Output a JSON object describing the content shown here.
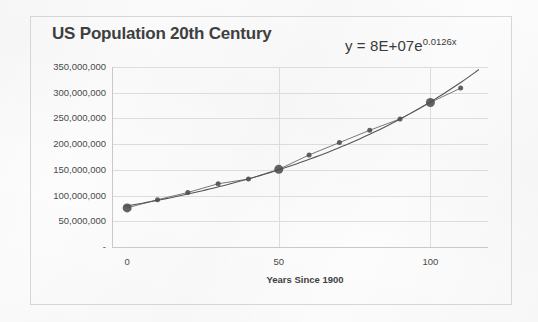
{
  "chart_data": {
    "type": "scatter",
    "title": "US Population 20th Century",
    "xlabel": "Years Since 1900",
    "ylabel": "",
    "annotation": "y = 8E+07e",
    "annotation_exponent": "0.0126x",
    "annotation_full": "y = 8E+07e^0.0126x",
    "trendline": "exponential",
    "grid": "horizontal",
    "legend": "none",
    "xlim": [
      -5,
      119
    ],
    "ylim": [
      0,
      350000000
    ],
    "x_ticks": [
      0,
      50,
      100
    ],
    "x_tick_labels": [
      "0",
      "50",
      "100"
    ],
    "y_ticks": [
      0,
      50000000,
      100000000,
      150000000,
      200000000,
      250000000,
      300000000,
      350000000
    ],
    "y_tick_labels": [
      "-",
      "50,000,000",
      "100,000,000",
      "150,000,000",
      "200,000,000",
      "250,000,000",
      "300,000,000",
      "350,000,000"
    ],
    "x": [
      0,
      10,
      20,
      30,
      40,
      50,
      60,
      70,
      80,
      90,
      100,
      110
    ],
    "values": [
      76000000,
      92000000,
      106000000,
      123000000,
      132000000,
      151000000,
      179000000,
      203000000,
      227000000,
      249000000,
      281000000,
      309000000
    ],
    "point_sizes": [
      9,
      5,
      5,
      5,
      5,
      9,
      5,
      5,
      5,
      5,
      9,
      5
    ],
    "series": [
      {
        "name": "US Population",
        "x": [
          0,
          10,
          20,
          30,
          40,
          50,
          60,
          70,
          80,
          90,
          100,
          110
        ],
        "values": [
          76000000,
          92000000,
          106000000,
          123000000,
          132000000,
          151000000,
          179000000,
          203000000,
          227000000,
          249000000,
          281000000,
          309000000
        ]
      }
    ],
    "colors": {
      "marker": "#4c4c4c",
      "trendline": "#555555",
      "gridline": "#dcdcdc",
      "axis": "#c9c9c9",
      "text": "#3f3f3f",
      "background": "#fdfdfd",
      "frame": "#d6d6d6"
    }
  }
}
